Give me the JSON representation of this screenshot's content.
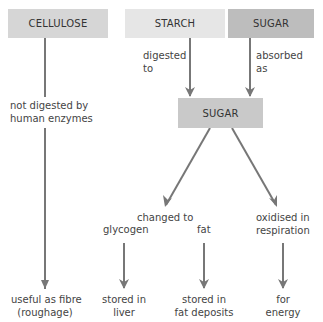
{
  "boxes": {
    "cellulose": {
      "label": "CELLULOSE",
      "color": "#d6d6d6"
    },
    "starch": {
      "label": "STARCH",
      "color": "#e6e6e6"
    },
    "sugar_top": {
      "label": "SUGAR",
      "color": "#bdbdbd"
    },
    "sugar_mid": {
      "label": "SUGAR",
      "color": "#c9c9c9"
    }
  },
  "labels": {
    "digested_to_1": "digested",
    "digested_to_2": "to",
    "absorbed_as_1": "absorbed",
    "absorbed_as_2": "as",
    "not_digested_1": "not digested by",
    "not_digested_2": "human enzymes",
    "changed_to": "changed to",
    "glycogen": "glycogen",
    "fat": "fat",
    "oxidised_1": "oxidised in",
    "oxidised_2": "respiration",
    "fibre_1": "useful as fibre",
    "fibre_2": "(roughage)",
    "liver_1": "stored in",
    "liver_2": "liver",
    "fat_dep_1": "stored in",
    "fat_dep_2": "fat deposits",
    "energy_1": "for",
    "energy_2": "energy"
  },
  "colors": {
    "arrow": "#777777"
  }
}
